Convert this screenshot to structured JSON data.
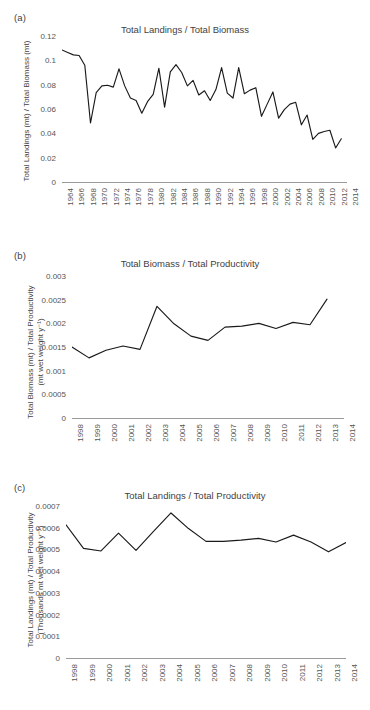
{
  "figure": {
    "panels": [
      {
        "label": "(a)",
        "title": "Total Landings / Total Biomass",
        "ylabel_line1": "Total Landings (mt) / Total Biomass (mt)",
        "ylabel_line2": "",
        "yticks": [
          "0",
          "0.02",
          "0.04",
          "0.06",
          "0.08",
          "0.1",
          "0.12"
        ],
        "xticks": [
          "1964",
          "1966",
          "1968",
          "1970",
          "1972",
          "1974",
          "1976",
          "1978",
          "1980",
          "1982",
          "1984",
          "1986",
          "1988",
          "1990",
          "1992",
          "1994",
          "1996",
          "1998",
          "2000",
          "2002",
          "2004",
          "2006",
          "2008",
          "2010",
          "2012",
          "2014"
        ]
      },
      {
        "label": "(b)",
        "title": "Total Biomass / Total Productivity",
        "ylabel_line1": "Total Biomass (mt) / Total Productivity",
        "ylabel_line2": "(mt wet weight y⁻¹)",
        "yticks": [
          "0",
          "0.0005",
          "0.001",
          "0.0015",
          "0.002",
          "0.0025",
          "0.003"
        ],
        "xticks": [
          "1998",
          "1999",
          "2000",
          "2001",
          "2002",
          "2003",
          "2004",
          "2005",
          "2006",
          "2007",
          "2008",
          "2009",
          "2010",
          "2011",
          "2012",
          "2013",
          "2014"
        ]
      },
      {
        "label": "(c)",
        "title": "Total Landings / Total Productivity",
        "ylabel_line1": "Total Landings (mt) / Total Productivity",
        "ylabel_line2": "(Thousands mt wet weight y⁻¹)",
        "yticks": [
          "0",
          "0.0001",
          "0.0002",
          "0.0003",
          "0.0004",
          "0.0005",
          "0.0006",
          "0.0007"
        ],
        "xticks": [
          "1998",
          "1999",
          "2000",
          "2001",
          "2002",
          "2003",
          "2004",
          "2005",
          "2006",
          "2007",
          "2008",
          "2009",
          "2010",
          "2011",
          "2012",
          "2013",
          "2014"
        ]
      }
    ],
    "line_color": "#1a1a1a",
    "axis_color": "#9a9a9a",
    "text_color": "#3f3f3f"
  },
  "chart_data": [
    {
      "type": "line",
      "panel": "(a)",
      "title": "Total Landings / Total Biomass",
      "xlabel": "",
      "ylabel": "Total Landings (mt) / Total Biomass (mt)",
      "xlim": [
        1964,
        2014
      ],
      "ylim": [
        0,
        0.12
      ],
      "grid": false,
      "legend": "none",
      "x": [
        1964,
        1965,
        1966,
        1967,
        1968,
        1969,
        1970,
        1971,
        1972,
        1973,
        1974,
        1975,
        1976,
        1977,
        1978,
        1979,
        1980,
        1981,
        1982,
        1983,
        1984,
        1985,
        1986,
        1987,
        1988,
        1989,
        1990,
        1991,
        1992,
        1993,
        1994,
        1995,
        1996,
        1997,
        1998,
        1999,
        2000,
        2001,
        2002,
        2003,
        2004,
        2005,
        2006,
        2007,
        2008,
        2009,
        2010,
        2011,
        2012,
        2013
      ],
      "values": [
        0.1085,
        0.1065,
        0.1045,
        0.104,
        0.096,
        0.0485,
        0.0735,
        0.079,
        0.0795,
        0.078,
        0.093,
        0.079,
        0.069,
        0.067,
        0.0565,
        0.066,
        0.072,
        0.0935,
        0.0615,
        0.0905,
        0.0965,
        0.09,
        0.079,
        0.0835,
        0.0715,
        0.075,
        0.067,
        0.076,
        0.094,
        0.073,
        0.069,
        0.094,
        0.0725,
        0.0755,
        0.0775,
        0.054,
        0.064,
        0.074,
        0.0525,
        0.0595,
        0.064,
        0.0655,
        0.047,
        0.055,
        0.035,
        0.04,
        0.0415,
        0.0425,
        0.028,
        0.0355
      ]
    },
    {
      "type": "line",
      "panel": "(b)",
      "title": "Total Biomass / Total Productivity",
      "xlabel": "",
      "ylabel": "Total Biomass (mt) / Total Productivity (mt wet weight y-1)",
      "xlim": [
        1998,
        2014
      ],
      "ylim": [
        0,
        0.003
      ],
      "grid": false,
      "legend": "none",
      "x": [
        1998,
        1999,
        2000,
        2001,
        2002,
        2003,
        2004,
        2005,
        2006,
        2007,
        2008,
        2009,
        2010,
        2011,
        2012,
        2013
      ],
      "values": [
        0.0015,
        0.00127,
        0.00143,
        0.00152,
        0.00145,
        0.00236,
        0.00199,
        0.00173,
        0.00164,
        0.00192,
        0.00194,
        0.002,
        0.00189,
        0.00202,
        0.00197,
        0.00251
      ]
    },
    {
      "type": "line",
      "panel": "(c)",
      "title": "Total Landings / Total Productivity",
      "xlabel": "",
      "ylabel": "Total Landings (mt) / Total Productivity (Thousands mt wet weight y-1)",
      "xlim": [
        1998,
        2014
      ],
      "ylim": [
        0,
        0.0007
      ],
      "grid": false,
      "legend": "none",
      "x": [
        1998,
        1999,
        2000,
        2001,
        2002,
        2003,
        2004,
        2005,
        2006,
        2007,
        2008,
        2009,
        2010,
        2011,
        2012,
        2013,
        2014
      ],
      "values": [
        0.000613,
        0.000505,
        0.000493,
        0.000575,
        0.000496,
        0.000583,
        0.000668,
        0.000596,
        0.000537,
        0.000537,
        0.000543,
        0.000551,
        0.000534,
        0.000566,
        0.000534,
        0.000489,
        0.000532
      ]
    }
  ]
}
